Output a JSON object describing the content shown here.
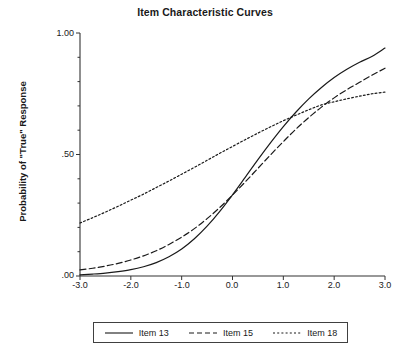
{
  "chart_data": {
    "type": "line",
    "title": "Item Characteristic Curves",
    "xlabel": "Stress Reaction Level (θ)",
    "ylabel": "Probability of \"True\" Response",
    "xlim": [
      -3.0,
      3.0
    ],
    "ylim": [
      0.0,
      1.0
    ],
    "grid": false,
    "legend_position": "bottom",
    "xticks": [
      "-3.0",
      "-2.0",
      "-1.0",
      "0.0",
      "1.0",
      "2.0",
      "3.0"
    ],
    "xtick_values": [
      -3.0,
      -2.0,
      -1.0,
      0.0,
      1.0,
      2.0,
      3.0
    ],
    "yticks": [
      ".00",
      ".50",
      "1.00"
    ],
    "ytick_values": [
      0.0,
      0.5,
      1.0
    ],
    "x": [
      -3.0,
      -2.75,
      -2.5,
      -2.25,
      -2.0,
      -1.75,
      -1.5,
      -1.25,
      -1.0,
      -0.75,
      -0.5,
      -0.25,
      0.0,
      0.25,
      0.5,
      0.75,
      1.0,
      1.25,
      1.5,
      1.75,
      2.0,
      2.25,
      2.5,
      2.75,
      3.0
    ],
    "series": [
      {
        "name": "Item 13",
        "style": "solid",
        "color": "#1a1a1a",
        "values": [
          0.005,
          0.008,
          0.012,
          0.018,
          0.026,
          0.038,
          0.055,
          0.079,
          0.111,
          0.153,
          0.205,
          0.266,
          0.334,
          0.406,
          0.479,
          0.549,
          0.615,
          0.675,
          0.729,
          0.776,
          0.817,
          0.851,
          0.88,
          0.904,
          0.938
        ]
      },
      {
        "name": "Item 15",
        "style": "dashed",
        "color": "#1a1a1a",
        "values": [
          0.025,
          0.032,
          0.041,
          0.052,
          0.066,
          0.083,
          0.104,
          0.13,
          0.16,
          0.195,
          0.236,
          0.282,
          0.333,
          0.387,
          0.443,
          0.499,
          0.553,
          0.605,
          0.652,
          0.695,
          0.733,
          0.767,
          0.797,
          0.827,
          0.855
        ]
      },
      {
        "name": "Item 18",
        "style": "dotted",
        "color": "#1a1a1a",
        "values": [
          0.218,
          0.24,
          0.263,
          0.287,
          0.312,
          0.337,
          0.364,
          0.391,
          0.419,
          0.447,
          0.476,
          0.505,
          0.533,
          0.561,
          0.588,
          0.614,
          0.639,
          0.662,
          0.684,
          0.704,
          0.717,
          0.729,
          0.74,
          0.75,
          0.757
        ]
      }
    ],
    "legend": [
      {
        "label": "Item 13",
        "style": "solid"
      },
      {
        "label": "Item 15",
        "style": "dashed"
      },
      {
        "label": "Item 18",
        "style": "dotted"
      }
    ]
  }
}
